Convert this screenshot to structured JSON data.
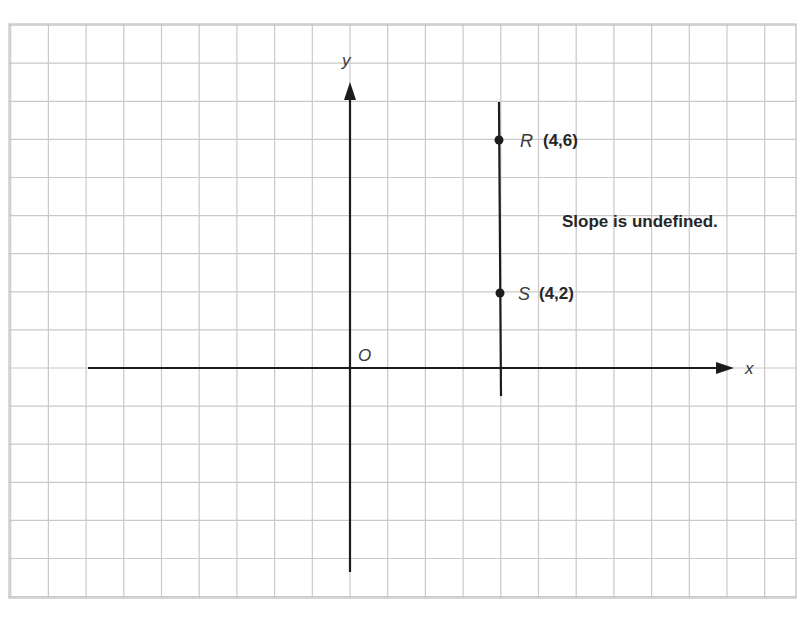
{
  "figure": {
    "axes": {
      "x_label": "x",
      "y_label": "y",
      "origin_label": "O"
    },
    "points": [
      {
        "name": "R",
        "coord_text": "(4,6)",
        "x": 4,
        "y": 6
      },
      {
        "name": "S",
        "coord_text": "(4,2)",
        "x": 4,
        "y": 2
      }
    ],
    "segment": {
      "type": "vertical line",
      "x": 4,
      "through": [
        "R",
        "S"
      ]
    },
    "annotation": "Slope is undefined.",
    "colors": {
      "grid": "#c9c9c9",
      "ink": "#1c1c1c",
      "label": "#3a3a3a",
      "background": "#ffffff"
    }
  }
}
